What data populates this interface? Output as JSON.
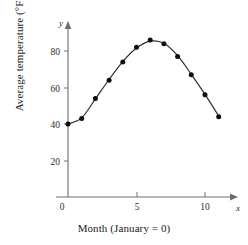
{
  "chart_data": {
    "type": "scatter",
    "title": "",
    "subtitle": "",
    "xlabel": "Month (January = 0)",
    "ylabel": "Average temperature (°F)",
    "x_axis_name": "x",
    "y_axis_name": "y",
    "x": [
      0,
      1,
      2,
      3,
      4,
      5,
      6,
      7,
      8,
      9,
      10,
      11
    ],
    "values": [
      40,
      43,
      54,
      64,
      74,
      82,
      86,
      84,
      77,
      67,
      56,
      44
    ],
    "series": [
      {
        "name": "Average temperature",
        "values": [
          40,
          43,
          54,
          64,
          74,
          82,
          86,
          84,
          77,
          67,
          56,
          44
        ]
      },
      {
        "name": "Fitted curve",
        "values": [
          40,
          43.4,
          53.8,
          64.4,
          74.2,
          81.6,
          85.4,
          84.2,
          77.4,
          67.2,
          56.2,
          44.4
        ]
      }
    ],
    "xlim": [
      0,
      12.2
    ],
    "ylim": [
      0,
      95
    ],
    "xticks": [
      0,
      5,
      10
    ],
    "xtick_labels": [
      "0",
      "5",
      "10"
    ],
    "yticks": [
      20,
      40,
      60,
      80
    ],
    "ytick_labels": [
      "20",
      "40",
      "60",
      "80"
    ],
    "grid": false,
    "legend": null,
    "marker": "filled-circle",
    "curve_color": "#2b2b2b",
    "marker_color": "#0d0d0d",
    "axis_color": "#6e6e6e",
    "background": "#ffffff"
  },
  "ticks": {
    "y": {
      "t80": "80",
      "t60": "60",
      "t40": "40",
      "t20": "20"
    },
    "x": {
      "t0": "0",
      "t5": "5",
      "t10": "10"
    }
  },
  "labels": {
    "y_axis_name": "y",
    "x_axis_name": "x",
    "y_title": "Average temperature (°F)",
    "x_title": "Month (January = 0)"
  }
}
